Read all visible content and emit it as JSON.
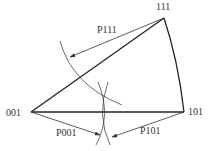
{
  "diagram": {
    "vertices": {
      "v111": {
        "label": "111",
        "x": 164,
        "y": 18
      },
      "v001": {
        "label": "001",
        "x": 31,
        "y": 112
      },
      "v101": {
        "label": "101",
        "x": 184,
        "y": 112
      }
    },
    "arrows": {
      "p111": {
        "label": "P111"
      },
      "p001": {
        "label": "P001"
      },
      "p101": {
        "label": "P101"
      }
    },
    "colors": {
      "line": "#222222",
      "thin": "#444444",
      "text": "#333333"
    }
  }
}
